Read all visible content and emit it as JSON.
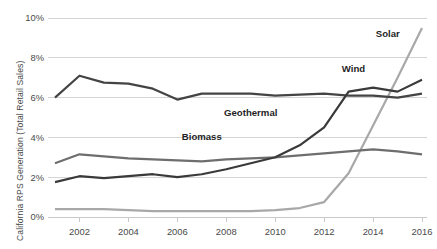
{
  "chart_data": {
    "type": "line",
    "title": "",
    "subtitle": "",
    "xlabel": "",
    "ylabel": "California RPS Generation (Total Retail Sales)",
    "x": [
      2001,
      2002,
      2003,
      2004,
      2005,
      2006,
      2007,
      2008,
      2009,
      2010,
      2011,
      2012,
      2013,
      2014,
      2015,
      2016
    ],
    "xlim": [
      2001,
      2016
    ],
    "ylim": [
      0,
      10
    ],
    "xtick_labels": [
      "2002",
      "2004",
      "2006",
      "2008",
      "2010",
      "2012",
      "2014",
      "2016"
    ],
    "xtick_values": [
      2002,
      2004,
      2006,
      2008,
      2010,
      2012,
      2014,
      2016
    ],
    "ytick_labels": [
      "0%",
      "2%",
      "4%",
      "6%",
      "8%",
      "10%"
    ],
    "ytick_values": [
      0,
      2,
      4,
      6,
      8,
      10
    ],
    "grid": "horizontal",
    "legend_position": "inline-annotations",
    "units": "percent",
    "series": [
      {
        "name": "Geothermal",
        "color": "#444444",
        "label_x": 2009,
        "label_y": 5.1,
        "values": [
          6.0,
          7.1,
          6.75,
          6.7,
          6.45,
          5.9,
          6.2,
          6.2,
          6.2,
          6.1,
          6.15,
          6.2,
          6.1,
          6.1,
          6.0,
          6.2
        ]
      },
      {
        "name": "Biomass",
        "color": "#6e6e6e",
        "label_x": 2007,
        "label_y": 3.85,
        "values": [
          2.7,
          3.15,
          3.05,
          2.95,
          2.9,
          2.85,
          2.8,
          2.9,
          2.95,
          3.0,
          3.1,
          3.2,
          3.3,
          3.4,
          3.3,
          3.15
        ]
      },
      {
        "name": "Wind",
        "color": "#3a3a3a",
        "label_x": 2013.2,
        "label_y": 7.3,
        "values": [
          1.75,
          2.05,
          1.95,
          2.05,
          2.15,
          2.0,
          2.15,
          2.4,
          2.7,
          3.0,
          3.6,
          4.5,
          6.3,
          6.5,
          6.3,
          6.9
        ]
      },
      {
        "name": "Solar",
        "color": "#a8a8a8",
        "label_x": 2014.6,
        "label_y": 9.05,
        "values": [
          0.4,
          0.4,
          0.4,
          0.35,
          0.3,
          0.3,
          0.3,
          0.3,
          0.3,
          0.35,
          0.45,
          0.75,
          2.2,
          4.6,
          7.0,
          9.5
        ]
      }
    ]
  },
  "axis": {
    "y_axis_caption": "California RPS Generation (Total Retail Sales)"
  }
}
